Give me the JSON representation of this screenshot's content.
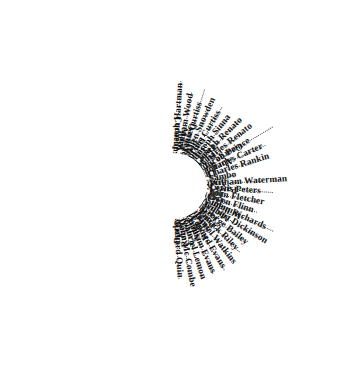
{
  "figure": {
    "kind": "radial-name-wheel",
    "title": "",
    "center_label": "",
    "ink_color": "#111111",
    "leader_color": "#2b2b2b",
    "background_color": "#ffffff",
    "spoke_count": 52
  },
  "names": [
    "Joseph Hartman",
    "William Wood",
    "John Curtiss",
    "Allen Snowden",
    "Thos Curtiss",
    "Joseph Sinna",
    "Joseph Renato",
    "Charles Renato",
    "Jacob Prince",
    "Charles Carter",
    "Charles Rankin",
    "Sambo",
    "William Waterman",
    "Lewis Peters",
    "John Fletcher",
    "Owen Flinn",
    "Simon Richards",
    "Gilbert Dickinson",
    "George Bailey",
    "Patrick Riley",
    "Daniel Watkins",
    "Edward Evans",
    "William Evans",
    "Gabriel Lemon",
    "John Mc Combe",
    "Richard Quin",
    "Cornelius Adams",
    "Mark Watkins",
    "David Roberson",
    "Peter Marks",
    "David Ruddle",
    "Jasper Cary",
    "Thos Timmins",
    "Roger Grant",
    "George Simmondas",
    "Abraham Tobin",
    "Thos Davis",
    "Cudjo",
    "Andrew Voto",
    "Patrick Sulivan",
    "Job Watkins",
    "Henry Ward",
    "William Meadows",
    "Michael Rupert",
    "Jacob Rupert",
    "Peter Fleming",
    "Skinner Peers",
    "Rodt Mc Leran",
    "Andrew Bunce",
    "Cornelius Rian",
    "Robert Atkison",
    "Darby Keaton"
  ]
}
